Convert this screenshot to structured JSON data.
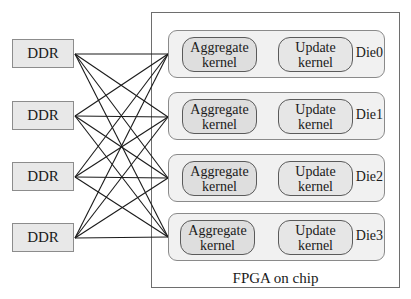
{
  "diagram": {
    "container_label": "FPGA on chip",
    "memory_nodes": [
      {
        "label": "DDR"
      },
      {
        "label": "DDR"
      },
      {
        "label": "DDR"
      },
      {
        "label": "DDR"
      }
    ],
    "dies": [
      {
        "label": "Die0",
        "kernels": [
          {
            "line1": "Aggregate",
            "line2": "kernel"
          },
          {
            "line1": "Update",
            "line2": "kernel"
          }
        ]
      },
      {
        "label": "Die1",
        "kernels": [
          {
            "line1": "Aggregate",
            "line2": "kernel"
          },
          {
            "line1": "Update",
            "line2": "kernel"
          }
        ]
      },
      {
        "label": "Die2",
        "kernels": [
          {
            "line1": "Aggregate",
            "line2": "kernel"
          },
          {
            "line1": "Update",
            "line2": "kernel"
          }
        ]
      },
      {
        "label": "Die3",
        "kernels": [
          {
            "line1": "Aggregate",
            "line2": "kernel"
          },
          {
            "line1": "Update",
            "line2": "kernel"
          }
        ]
      }
    ],
    "connections": "all-to-all (each DDR connects to every Die)",
    "colors": {
      "ddr_fill": "#e8e8e8",
      "die_fill": "#f1f1f1",
      "kernel_fill": "#dedede",
      "line": "#1a1a1a"
    }
  }
}
